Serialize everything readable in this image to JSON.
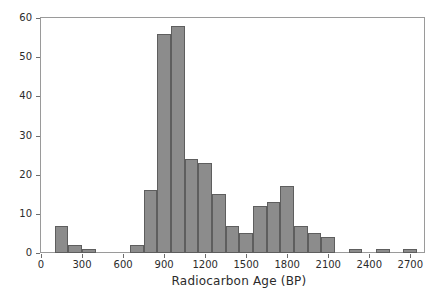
{
  "chart_data": {
    "type": "bar",
    "title": "",
    "subtitle": "",
    "xlabel": "Radiocarbon Age (BP)",
    "ylabel": "Frequency",
    "xlim": [
      0,
      2800
    ],
    "ylim": [
      0,
      60
    ],
    "bin_width": 100,
    "grid": false,
    "legend": null,
    "bar_color": "#8c8c8c",
    "bar_edge_color": "#5e5e5e",
    "axis_color": "#9a9a9a",
    "text_color": "#2b2b2b",
    "background": "#ffffff",
    "xticks": [
      0,
      300,
      600,
      900,
      1200,
      1500,
      1800,
      2100,
      2400,
      2700
    ],
    "xtick_labels": [
      "0",
      "300",
      "600",
      "900",
      "1200",
      "1500",
      "1800",
      "2100",
      "2400",
      "2700"
    ],
    "yticks": [
      0,
      10,
      20,
      30,
      40,
      50,
      60
    ],
    "ytick_labels": [
      "0",
      "10",
      "20",
      "30",
      "40",
      "50",
      "60"
    ],
    "bins": [
      {
        "start": 100,
        "end": 200,
        "value": 7
      },
      {
        "start": 200,
        "end": 300,
        "value": 2
      },
      {
        "start": 300,
        "end": 400,
        "value": 1
      },
      {
        "start": 650,
        "end": 750,
        "value": 2
      },
      {
        "start": 750,
        "end": 850,
        "value": 16
      },
      {
        "start": 850,
        "end": 950,
        "value": 56
      },
      {
        "start": 950,
        "end": 1050,
        "value": 58
      },
      {
        "start": 1050,
        "end": 1150,
        "value": 24
      },
      {
        "start": 1150,
        "end": 1250,
        "value": 23
      },
      {
        "start": 1250,
        "end": 1350,
        "value": 15
      },
      {
        "start": 1350,
        "end": 1450,
        "value": 7
      },
      {
        "start": 1450,
        "end": 1550,
        "value": 5
      },
      {
        "start": 1550,
        "end": 1650,
        "value": 12
      },
      {
        "start": 1650,
        "end": 1750,
        "value": 13
      },
      {
        "start": 1750,
        "end": 1850,
        "value": 17
      },
      {
        "start": 1850,
        "end": 1950,
        "value": 7
      },
      {
        "start": 1950,
        "end": 2050,
        "value": 5
      },
      {
        "start": 2050,
        "end": 2150,
        "value": 4
      },
      {
        "start": 2250,
        "end": 2350,
        "value": 1
      },
      {
        "start": 2450,
        "end": 2550,
        "value": 1
      },
      {
        "start": 2650,
        "end": 2750,
        "value": 1
      }
    ],
    "categories": [
      "100-200",
      "200-300",
      "300-400",
      "650-750",
      "750-850",
      "850-950",
      "950-1050",
      "1050-1150",
      "1150-1250",
      "1250-1350",
      "1350-1450",
      "1450-1550",
      "1550-1650",
      "1650-1750",
      "1750-1850",
      "1850-1950",
      "1950-2050",
      "2050-2150",
      "2250-2350",
      "2450-2550",
      "2650-2750"
    ],
    "values": [
      7,
      2,
      1,
      2,
      16,
      56,
      58,
      24,
      23,
      15,
      7,
      5,
      12,
      13,
      17,
      7,
      5,
      4,
      1,
      1,
      1
    ]
  }
}
